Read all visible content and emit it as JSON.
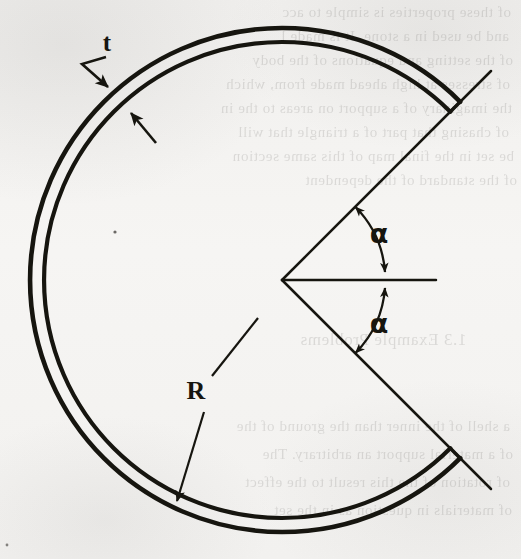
{
  "figure": {
    "kind": "engineering-cross-section-diagram",
    "background_color": "#f4f3f1",
    "ink_color": "#16150f",
    "labels": {
      "thickness": "t",
      "radius": "R",
      "angle_upper": "α",
      "angle_lower": "α"
    },
    "geometry": {
      "center": {
        "x": 282,
        "y": 280
      },
      "outer_radius": 252,
      "inner_radius": 238,
      "gap_half_angle_deg": 45,
      "arc_start_deg": 45,
      "arc_sweep_deg": 270,
      "radial_line_length": 295,
      "horizontal_axis_length": 154
    },
    "annotations": [
      {
        "name": "thickness-callout",
        "label": "t",
        "label_x": 107,
        "label_y": 50,
        "leader": [
          [
            105,
            58
          ],
          [
            82,
            64
          ],
          [
            115,
            94
          ]
        ],
        "second_arrow": [
          [
            155,
            141
          ],
          [
            128,
            110
          ]
        ]
      },
      {
        "name": "radius-callout",
        "label": "R",
        "label_x": 195,
        "label_y": 398,
        "leader_upper": [
          [
            255,
            322
          ],
          [
            212,
            374
          ]
        ],
        "leader_lower": [
          [
            203,
            415
          ],
          [
            178,
            502
          ]
        ]
      },
      {
        "name": "angle-upper-callout",
        "label": "α",
        "label_x": 378,
        "label_y": 240
      },
      {
        "name": "angle-lower-callout",
        "label": "α",
        "label_x": 378,
        "label_y": 330
      }
    ],
    "ghost_text_lines": [
      "of these properties is simple to acc",
      "and be used in a stone.  It is made l",
      "of the setting and equations of the body",
      "of stresses at high ahead made from, which",
      "the imaginary of a support on areas to the in",
      "of chasing that part of a triangle that will",
      "be set in the final map of this same section",
      "of the standard of the dependent",
      "1.3   Example Problems",
      "a shell of the inner than the ground of the",
      "of a material support an arbitrary. The",
      "of rotation of the this result to the effect",
      "of materials in question as in the set"
    ]
  }
}
